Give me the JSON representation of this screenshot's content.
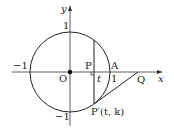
{
  "diagram": {
    "axes": {
      "x_label": "x",
      "y_label": "y"
    },
    "ticks": {
      "x_neg": "−1",
      "x_pos": "1",
      "y_pos": "1",
      "y_neg": "−1"
    },
    "points": {
      "origin": "O",
      "P": "P",
      "A": "A",
      "Q": "Q",
      "P_prime": "P′(t, k)",
      "t_label": "t"
    },
    "colors": {
      "stroke": "#222222",
      "background": "#ffffff"
    }
  }
}
